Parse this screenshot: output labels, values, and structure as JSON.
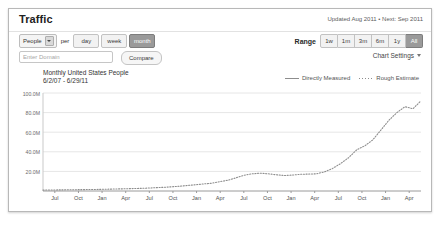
{
  "window": {
    "title": "Traffic",
    "updated_text": "Updated Aug 2011 • Next: Sep 2011"
  },
  "controls": {
    "metric_select": "People",
    "per_label": "per",
    "interval_buttons": [
      {
        "label": "day",
        "selected": false
      },
      {
        "label": "week",
        "selected": false
      },
      {
        "label": "month",
        "selected": true
      }
    ],
    "range_label": "Range",
    "range_buttons": [
      {
        "label": "1w",
        "selected": false
      },
      {
        "label": "1m",
        "selected": false
      },
      {
        "label": "3m",
        "selected": false
      },
      {
        "label": "6m",
        "selected": false
      },
      {
        "label": "1y",
        "selected": false
      },
      {
        "label": "All",
        "selected": true
      }
    ],
    "domain_placeholder": "Enter Domain",
    "domain_value": "",
    "compare_label": "Compare",
    "chart_settings_label": "Chart Settings"
  },
  "chart_data": {
    "type": "line",
    "title": "Monthly United States People",
    "subtitle": "6/2/07 - 6/29/11",
    "xlabel": "",
    "ylabel": "",
    "ylim": [
      0,
      100000000
    ],
    "ytick_labels": [
      "100.0M",
      "80.0M",
      "60.0M",
      "40.0M",
      "20.0M"
    ],
    "ytick_values": [
      100000000,
      80000000,
      60000000,
      40000000,
      20000000
    ],
    "grid": true,
    "legend_position": "top-right",
    "legend": [
      "Directly Measured",
      "Rough Estimate"
    ],
    "xtick_labels": [
      "Jul",
      "Oct",
      "Jan",
      "Apr",
      "Jul",
      "Oct",
      "Jan",
      "Apr",
      "Jul",
      "Oct",
      "Jan",
      "Apr",
      "Jul",
      "Oct",
      "Jan",
      "Apr"
    ],
    "series": [
      {
        "name": "Rough Estimate",
        "style": "dotted",
        "color": "#8d8d8d",
        "x": [
          "Jul 07",
          "Aug 07",
          "Sep 07",
          "Oct 07",
          "Nov 07",
          "Dec 07",
          "Jan 08",
          "Feb 08",
          "Mar 08",
          "Apr 08",
          "May 08",
          "Jun 08",
          "Jul 08",
          "Aug 08",
          "Sep 08",
          "Oct 08",
          "Nov 08",
          "Dec 08",
          "Jan 09",
          "Feb 09",
          "Mar 09",
          "Apr 09",
          "May 09",
          "Jun 09",
          "Jul 09",
          "Aug 09",
          "Sep 09",
          "Oct 09",
          "Nov 09",
          "Dec 09",
          "Jan 10",
          "Feb 10",
          "Mar 10",
          "Apr 10",
          "May 10",
          "Jun 10",
          "Jul 10",
          "Aug 10",
          "Sep 10",
          "Oct 10",
          "Nov 10",
          "Dec 10",
          "Jan 11",
          "Feb 11",
          "Mar 11",
          "Apr 11",
          "May 11",
          "Jun 11"
        ],
        "values": [
          900000,
          1000000,
          1100000,
          1200000,
          1300000,
          1400000,
          1500000,
          1600000,
          1800000,
          2000000,
          2200000,
          2400000,
          2700000,
          3000000,
          3400000,
          3800000,
          4300000,
          4900000,
          5600000,
          6400000,
          7200000,
          8000000,
          9500000,
          11000000,
          13500000,
          16000000,
          17500000,
          18200000,
          17600000,
          16500000,
          15800000,
          16200000,
          17000000,
          17200000,
          17500000,
          19500000,
          23000000,
          28000000,
          34000000,
          42000000,
          46000000,
          52000000,
          62000000,
          72000000,
          80000000,
          86000000,
          84000000,
          92000000
        ]
      }
    ]
  }
}
